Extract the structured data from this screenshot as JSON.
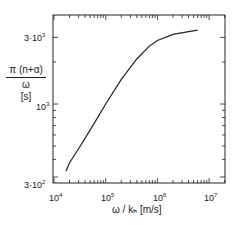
{
  "chart_data": {
    "type": "line",
    "title": "",
    "xlabel": "ω / k_h [m/s]",
    "ylabel": "π(n+α) / ω [s]",
    "xscale": "log",
    "yscale": "log",
    "xlim": [
      10000,
      20000000
    ],
    "ylim": [
      300,
      3500
    ],
    "x_ticks": [
      "10^4",
      "10^5",
      "10^6",
      "10^7"
    ],
    "y_ticks": [
      "3·10^2",
      "10^3",
      "3·10^3"
    ],
    "grid": false,
    "legend": null,
    "series": [
      {
        "name": "curve",
        "x": [
          17000,
          20000,
          30000,
          50000,
          100000,
          200000,
          400000,
          700000,
          1000000,
          2000000,
          4000000,
          6000000
        ],
        "y": [
          330,
          380,
          480,
          650,
          1000,
          1500,
          2100,
          2600,
          2850,
          3150,
          3300,
          3380
        ]
      }
    ]
  },
  "labels": {
    "ylabel_num": "π (n+α)",
    "ylabel_den": "ω",
    "ylabel_unit": "[s]",
    "xlabel": "ω / kₕ [m/s]",
    "ytick_top": "3·10",
    "ytick_top_exp": "3",
    "ytick_mid": "10",
    "ytick_mid_exp": "3",
    "ytick_bot": "3·10",
    "ytick_bot_exp": "2",
    "xtick_base": "10",
    "xtick_exps": [
      "4",
      "5",
      "6",
      "7"
    ]
  }
}
